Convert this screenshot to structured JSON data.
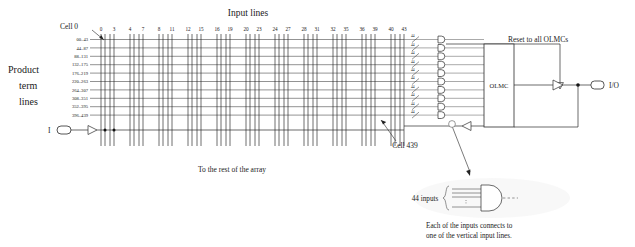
{
  "diagram": {
    "title_input_lines": "Input lines",
    "label_cell0": "Cell 0",
    "label_cell439": "Cell 439",
    "label_product_term_1": "Product",
    "label_product_term_2": "term",
    "label_product_term_3": "lines",
    "label_rest_of_array": "To the rest of the array",
    "label_reset": "Reset to all OLMCs",
    "label_olmc": "OLMC",
    "label_io": "I/O",
    "label_input_pad": "I",
    "label_44_inputs": "44 inputs",
    "caption_line1": "Each of the inputs connects to",
    "caption_line2": "one of the vertical input lines.",
    "bus_width": "44",
    "input_line_numbers": [
      "0",
      "3",
      "4",
      "7",
      "8",
      "11",
      "12",
      "15",
      "16",
      "19",
      "20",
      "23",
      "24",
      "27",
      "28",
      "31",
      "32",
      "35",
      "36",
      "39",
      "40",
      "43"
    ],
    "input_line_group_pairs": [
      {
        "first": "0",
        "last": "3"
      },
      {
        "first": "4",
        "last": "7"
      },
      {
        "first": "8",
        "last": "11"
      },
      {
        "first": "12",
        "last": "15"
      },
      {
        "first": "16",
        "last": "19"
      },
      {
        "first": "20",
        "last": "23"
      },
      {
        "first": "24",
        "last": "27"
      },
      {
        "first": "28",
        "last": "31"
      },
      {
        "first": "32",
        "last": "35"
      },
      {
        "first": "36",
        "last": "39"
      },
      {
        "first": "40",
        "last": "43"
      }
    ],
    "product_term_ranges": [
      "00–43",
      "44–87",
      "88–131",
      "132–175",
      "176–219",
      "220–263",
      "264–307",
      "308–351",
      "352–395",
      "396–439"
    ],
    "and_gate_count": 10,
    "colors": {
      "background": "#ffffff",
      "ink": "#1a1a1a",
      "wire": "#2b2b2b",
      "grid": "#4a4a4a"
    }
  }
}
